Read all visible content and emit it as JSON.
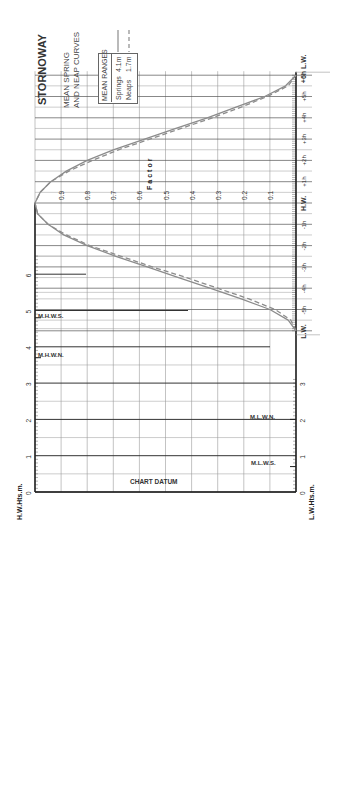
{
  "title": "STORNOWAY",
  "subtitle_line1": "MEAN SPRING",
  "subtitle_line2": "AND NEAP CURVES",
  "legend": {
    "header": "MEAN RANGES",
    "springs_label": "Springs",
    "springs_value": "4.1m",
    "neaps_label": "Neaps",
    "neaps_value": "1.7m"
  },
  "factor_axis_label": "Factor",
  "hw_axis_label": "H.W.Hts.m.",
  "lw_axis_label": "L.W.Hts.m.",
  "chart_datum_label": "CHART DATUM",
  "levels": {
    "mhws": "M.H.W.S.",
    "mhwn": "M.H.W.N.",
    "mlwn": "M.L.W.N.",
    "mlws": "M.L.W.S."
  },
  "colors": {
    "grid": "#9a9a9a",
    "axis": "#222222",
    "springs_curve": "#8c8c8c",
    "neaps_curve": "#8c8c8c"
  },
  "chart_data": {
    "type": "line",
    "orientation": "rotated 90° counter-clockwise (time axis vertical)",
    "x_time_labels": [
      "L.W.",
      "-5h",
      "-4h",
      "-3h",
      "-2h",
      "-1h",
      "H.W.",
      "+1h",
      "+2h",
      "+3h",
      "+4h",
      "+5h",
      "+6h L.W."
    ],
    "x_hours": [
      -6,
      -5,
      -4,
      -3,
      -2,
      -1,
      0,
      1,
      2,
      3,
      4,
      5,
      6
    ],
    "factor_ticks": [
      0.1,
      0.2,
      0.3,
      0.4,
      0.5,
      0.6,
      0.7,
      0.8,
      0.9
    ],
    "hw_height_ticks": [
      0,
      1,
      2,
      3,
      4,
      5,
      6
    ],
    "lw_height_ticks": [
      0,
      1,
      2,
      3
    ],
    "series": [
      {
        "name": "Springs (4.1m)",
        "style": "solid",
        "hours": [
          -6,
          -5.5,
          -5,
          -4.5,
          -4,
          -3.5,
          -3,
          -2.5,
          -2,
          -1.5,
          -1,
          -0.5,
          0,
          0.5,
          1,
          1.5,
          2,
          2.5,
          3,
          3.5,
          4,
          4.5,
          5,
          5.5,
          6
        ],
        "factor": [
          0.0,
          0.03,
          0.1,
          0.21,
          0.33,
          0.45,
          0.57,
          0.69,
          0.8,
          0.89,
          0.95,
          0.99,
          1.0,
          0.98,
          0.94,
          0.88,
          0.8,
          0.7,
          0.58,
          0.46,
          0.34,
          0.23,
          0.12,
          0.04,
          0.0
        ]
      },
      {
        "name": "Neaps (1.7m)",
        "style": "dashed",
        "hours": [
          -6,
          -5.5,
          -5,
          -4.5,
          -4,
          -3.5,
          -3,
          -2.5,
          -2,
          -1.5,
          -1,
          -0.5,
          0,
          0.5,
          1,
          1.5,
          2,
          2.5,
          3,
          3.5,
          4,
          4.5,
          5,
          5.5,
          6
        ],
        "factor": [
          0.0,
          0.02,
          0.08,
          0.18,
          0.3,
          0.42,
          0.55,
          0.67,
          0.79,
          0.88,
          0.95,
          0.99,
          1.0,
          0.98,
          0.94,
          0.87,
          0.78,
          0.68,
          0.56,
          0.44,
          0.32,
          0.21,
          0.11,
          0.03,
          0.0
        ]
      }
    ],
    "height_levels": {
      "M.H.W.S.": 4.8,
      "M.H.W.N.": 3.7,
      "M.L.W.N.": 2.0,
      "M.L.W.S.": 0.7
    },
    "xlabel": "Time from H.W. (hours)",
    "ylabel": "Factor",
    "ylim": [
      0,
      1
    ],
    "grid": true
  }
}
